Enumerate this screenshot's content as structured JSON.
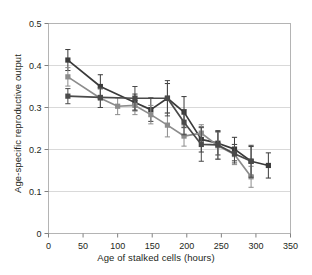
{
  "chart_data": {
    "type": "line",
    "title": "",
    "xlabel": "Age of stalked cells (hours)",
    "ylabel": "Age-specific reproductive output",
    "xlim": [
      0,
      350
    ],
    "ylim": [
      0,
      0.5
    ],
    "xticks": [
      0,
      50,
      100,
      150,
      200,
      250,
      300,
      350
    ],
    "yticks": [
      0,
      0.1,
      0.2,
      0.3,
      0.4,
      0.5
    ],
    "xtick_labels": [
      "0",
      "50",
      "100",
      "150",
      "200",
      "250",
      "300",
      "350"
    ],
    "ytick_labels": [
      "0",
      "0.1",
      "0.2",
      "0.3",
      "0.4",
      "0.5"
    ],
    "grid": "horizontal",
    "legend": "none",
    "error_bars": "vertical",
    "series": [
      {
        "name": "dark",
        "color": "#3a3a3a",
        "marker": "square",
        "x": [
          28,
          75,
          125,
          148,
          172,
          196,
          221,
          245,
          269,
          293,
          318
        ],
        "y": [
          0.413,
          0.35,
          0.312,
          0.295,
          0.322,
          0.289,
          0.224,
          0.215,
          0.201,
          0.172,
          0.162
        ],
        "yerr": [
          0.025,
          0.028,
          0.02,
          0.028,
          0.035,
          0.037,
          0.03,
          0.028,
          0.028,
          0.035,
          0.03
        ]
      },
      {
        "name": "mid-gray",
        "color": "#8c8c8c",
        "marker": "square",
        "x": [
          28,
          75,
          100,
          125,
          148,
          172,
          196,
          221,
          245,
          269,
          293
        ],
        "y": [
          0.373,
          0.322,
          0.303,
          0.305,
          0.283,
          0.258,
          0.232,
          0.239,
          0.209,
          0.188,
          0.135
        ],
        "yerr": [
          0.022,
          0.022,
          0.02,
          0.022,
          0.022,
          0.028,
          0.024,
          0.02,
          0.032,
          0.024,
          0.025
        ]
      },
      {
        "name": "flat-dark",
        "color": "#4a4a4a",
        "marker": "square",
        "x": [
          28,
          75,
          125,
          172,
          196,
          221,
          245,
          269,
          293
        ],
        "y": [
          0.327,
          0.324,
          0.322,
          0.322,
          0.265,
          0.212,
          0.211,
          0.19,
          0.172
        ],
        "yerr": [
          0.018,
          0.024,
          0.028,
          0.042,
          0.03,
          0.04,
          0.034,
          0.022,
          0.038
        ]
      }
    ]
  }
}
